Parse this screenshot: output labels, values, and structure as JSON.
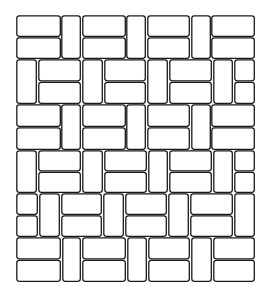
{
  "figure": {
    "title": "Brick paving pattern line drawing",
    "stroke_color": "#1a1a1a",
    "background_color": "#ffffff",
    "brick_fill": "#ffffff",
    "corner_radius": 2.5,
    "gap": 1.5,
    "bounds": {
      "x0": 16,
      "y0": 15,
      "x1": 255,
      "y1": 282
    }
  },
  "rows": [
    {
      "name": "row-1",
      "y0": 15,
      "y1": 59,
      "cells": [
        {
          "type": "h2",
          "x0": 16,
          "x1": 61
        },
        {
          "type": "v",
          "x0": 61,
          "x1": 81
        },
        {
          "type": "h2",
          "x0": 82,
          "x1": 126
        },
        {
          "type": "v",
          "x0": 126,
          "x1": 146
        },
        {
          "type": "h2",
          "x0": 147,
          "x1": 190
        },
        {
          "type": "v",
          "x0": 191,
          "x1": 211
        },
        {
          "type": "h2",
          "x0": 211,
          "x1": 255
        }
      ]
    },
    {
      "name": "row-2",
      "y0": 59,
      "y1": 104,
      "cells": [
        {
          "type": "v",
          "x0": 16,
          "x1": 37
        },
        {
          "type": "h2",
          "x0": 38,
          "x1": 81
        },
        {
          "type": "v",
          "x0": 82,
          "x1": 103
        },
        {
          "type": "h2",
          "x0": 104,
          "x1": 146
        },
        {
          "type": "v",
          "x0": 147,
          "x1": 168
        },
        {
          "type": "h2",
          "x0": 169,
          "x1": 212
        },
        {
          "type": "v",
          "x0": 213,
          "x1": 233
        },
        {
          "type": "h2",
          "x0": 234,
          "x1": 255
        }
      ]
    },
    {
      "name": "row-3",
      "y0": 104,
      "y1": 150,
      "cells": [
        {
          "type": "h2",
          "x0": 16,
          "x1": 61
        },
        {
          "type": "v",
          "x0": 61,
          "x1": 81
        },
        {
          "type": "h2",
          "x0": 82,
          "x1": 126
        },
        {
          "type": "v",
          "x0": 126,
          "x1": 146
        },
        {
          "type": "h2",
          "x0": 147,
          "x1": 190
        },
        {
          "type": "v",
          "x0": 191,
          "x1": 211
        },
        {
          "type": "h2",
          "x0": 211,
          "x1": 255
        }
      ]
    },
    {
      "name": "row-4",
      "y0": 150,
      "y1": 193,
      "cells": [
        {
          "type": "v",
          "x0": 16,
          "x1": 37
        },
        {
          "type": "h2",
          "x0": 38,
          "x1": 81
        },
        {
          "type": "v",
          "x0": 82,
          "x1": 103
        },
        {
          "type": "h2",
          "x0": 104,
          "x1": 147
        },
        {
          "type": "v",
          "x0": 148,
          "x1": 168
        },
        {
          "type": "h2",
          "x0": 169,
          "x1": 212
        },
        {
          "type": "v",
          "x0": 213,
          "x1": 233
        },
        {
          "type": "h2",
          "x0": 234,
          "x1": 255
        }
      ]
    },
    {
      "name": "row-5",
      "y0": 193,
      "y1": 237,
      "cells": [
        {
          "type": "h2",
          "x0": 16,
          "x1": 38
        },
        {
          "type": "v",
          "x0": 39,
          "x1": 60
        },
        {
          "type": "h2",
          "x0": 61,
          "x1": 102
        },
        {
          "type": "v",
          "x0": 103,
          "x1": 124
        },
        {
          "type": "h2",
          "x0": 125,
          "x1": 167
        },
        {
          "type": "v",
          "x0": 168,
          "x1": 189
        },
        {
          "type": "h2",
          "x0": 190,
          "x1": 233
        },
        {
          "type": "v",
          "x0": 234,
          "x1": 255
        }
      ]
    },
    {
      "name": "row-6",
      "y0": 237,
      "y1": 282,
      "cells": [
        {
          "type": "h2",
          "x0": 16,
          "x1": 61
        },
        {
          "type": "v",
          "x0": 62,
          "x1": 81
        },
        {
          "type": "h2",
          "x0": 82,
          "x1": 126
        },
        {
          "type": "v",
          "x0": 127,
          "x1": 147
        },
        {
          "type": "h2",
          "x0": 148,
          "x1": 190
        },
        {
          "type": "v",
          "x0": 191,
          "x1": 212
        },
        {
          "type": "h2",
          "x0": 213,
          "x1": 255
        }
      ]
    }
  ]
}
